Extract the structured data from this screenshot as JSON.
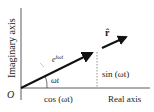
{
  "diagram": {
    "axes": {
      "y_label": "Imaginary axis",
      "x_label": "Real axis",
      "origin_label": "O"
    },
    "vector": {
      "label_base": "e",
      "label_exp": "iωt",
      "angle_label": "ωt"
    },
    "components": {
      "horizontal": "cos (ωt)",
      "vertical": "sin (ωt)"
    },
    "unit_vector": {
      "label": "r̂"
    },
    "colors": {
      "line": "#111111",
      "axis": "#333333",
      "text": "#222222",
      "dashed": "#777777"
    }
  }
}
